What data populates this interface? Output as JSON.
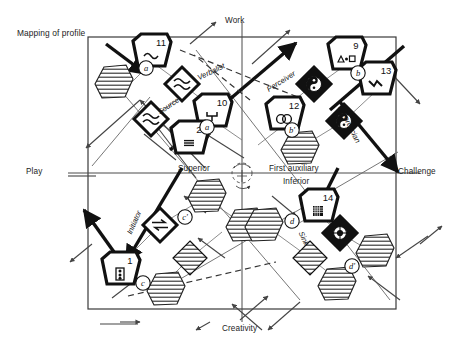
{
  "title": "Mapping of profile",
  "axes": {
    "top": "Work",
    "bottom": "Creativity",
    "left": "Play",
    "right": "Challenge"
  },
  "center_labels": {
    "superior": "Superior",
    "inferior": "Inferior",
    "first_auxiliary": "First auxiliary"
  },
  "diagonal_labels": [
    {
      "name": "verbalist",
      "text": "Verbalist",
      "x": 196,
      "y": 74,
      "rot": -26
    },
    {
      "name": "perceiver",
      "text": "Perceiver",
      "x": 265,
      "y": 86,
      "rot": -32
    },
    {
      "name": "source",
      "text": "Source",
      "x": 156,
      "y": 109,
      "rot": -34
    },
    {
      "name": "theoretician",
      "text": "Theoretician",
      "x": 344,
      "y": 103,
      "rot": 64
    },
    {
      "name": "initiator",
      "text": "Initiator",
      "x": 125,
      "y": 232,
      "rot": -66
    },
    {
      "name": "sink",
      "text": "Sink",
      "x": 305,
      "y": 230,
      "rot": 66
    }
  ],
  "nodes": [
    {
      "id": "11",
      "number": "11",
      "glyph": "wave",
      "x": 152,
      "y": 50,
      "shape": "pent",
      "bold": true
    },
    {
      "id": "10",
      "number": "10",
      "glyph": "fork",
      "x": 213,
      "y": 110,
      "shape": "pent",
      "bold": true
    },
    {
      "id": "2",
      "number": "2",
      "glyph": "equiv",
      "x": 190,
      "y": 137,
      "shape": "pent",
      "bold": true
    },
    {
      "id": "12",
      "number": "12",
      "glyph": "twocircle",
      "x": 285,
      "y": 113,
      "shape": "pent",
      "bold": true
    },
    {
      "id": "9",
      "number": "9",
      "glyph": "trisqr",
      "x": 347,
      "y": 53,
      "shape": "pent",
      "bold": true
    },
    {
      "id": "13",
      "number": "13",
      "glyph": "zigzag",
      "x": 377,
      "y": 78,
      "shape": "pent",
      "bold": true
    },
    {
      "id": "1",
      "number": "1",
      "glyph": "domino",
      "x": 121,
      "y": 268,
      "shape": "pent",
      "bold": true
    },
    {
      "id": "14",
      "number": "14",
      "glyph": "grid",
      "x": 319,
      "y": 205,
      "shape": "pent",
      "bold": true
    }
  ],
  "badges": [
    {
      "id": "a1",
      "label": "a",
      "x": 146,
      "y": 68
    },
    {
      "id": "a2",
      "label": "a",
      "x": 207,
      "y": 127
    },
    {
      "id": "b1",
      "label": "b",
      "x": 358,
      "y": 73
    },
    {
      "id": "b2",
      "label": "b'",
      "x": 292,
      "y": 130
    },
    {
      "id": "c1",
      "label": "c'",
      "x": 185,
      "y": 217
    },
    {
      "id": "c2",
      "label": "c",
      "x": 143,
      "y": 283
    },
    {
      "id": "d1",
      "label": "d",
      "x": 292,
      "y": 221
    },
    {
      "id": "d2",
      "label": "d'",
      "x": 352,
      "y": 266
    }
  ],
  "diamonds": [
    {
      "id": "dm-wave-1",
      "glyph": "dwave",
      "x": 182,
      "y": 84,
      "fill": "white",
      "bold": true
    },
    {
      "id": "dm-wave-2",
      "glyph": "dwave",
      "x": 151,
      "y": 119,
      "fill": "white",
      "bold": true
    },
    {
      "id": "dm-yin-1",
      "glyph": "yinyang",
      "x": 314,
      "y": 84,
      "fill": "black",
      "bold": true
    },
    {
      "id": "dm-yin-2",
      "glyph": "yinyang",
      "x": 344,
      "y": 121,
      "fill": "black",
      "bold": true
    },
    {
      "id": "dm-eq-1",
      "glyph": "rlarrow",
      "x": 160,
      "y": 225,
      "fill": "white",
      "bold": true
    },
    {
      "id": "dm-tgt-1",
      "glyph": "target",
      "x": 340,
      "y": 233,
      "fill": "black",
      "bold": true
    },
    {
      "id": "dm-h-1",
      "glyph": "hatch",
      "x": 190,
      "y": 258,
      "fill": "hatch",
      "bold": false
    },
    {
      "id": "dm-h-2",
      "glyph": "hatch",
      "x": 310,
      "y": 258,
      "fill": "hatch",
      "bold": false
    }
  ],
  "hatched_shapes": [
    {
      "id": "h-upper-left",
      "x": 114,
      "y": 82
    },
    {
      "id": "h-first-aux",
      "x": 300,
      "y": 148
    },
    {
      "id": "h-ll-top",
      "x": 207,
      "y": 196
    },
    {
      "id": "h-ll-right",
      "x": 245,
      "y": 225
    },
    {
      "id": "h-ll-bottom",
      "x": 166,
      "y": 289
    },
    {
      "id": "h-lr-left",
      "x": 264,
      "y": 225
    },
    {
      "id": "h-lr-right",
      "x": 375,
      "y": 251
    },
    {
      "id": "h-lr-bottom",
      "x": 337,
      "y": 284
    }
  ],
  "colors": {
    "stroke": "#111111",
    "thin": "#555555",
    "text": "#1a1a1a",
    "hatch": "#222222",
    "background": "#ffffff"
  }
}
